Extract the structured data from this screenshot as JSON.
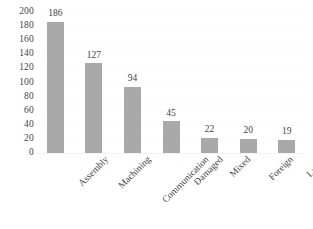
{
  "chart_data": {
    "type": "bar",
    "title": "",
    "xlabel": "",
    "ylabel": "",
    "categories": [
      "Assembly",
      "Machining",
      "Communication",
      "Damaged",
      "Mixed",
      "Foreign",
      "Labels"
    ],
    "values": [
      186,
      127,
      94,
      45,
      22,
      20,
      19
    ],
    "value_labels": [
      "186",
      "127",
      "94",
      "45",
      "22",
      "20",
      "19"
    ],
    "ylim": [
      0,
      200
    ],
    "ytick_step": 20,
    "ytick_labels": [
      "200",
      "180",
      "160",
      "140",
      "120",
      "100",
      "80",
      "60",
      "40",
      "20",
      "0"
    ],
    "ytick_values": [
      200,
      180,
      160,
      140,
      120,
      100,
      80,
      60,
      40,
      20,
      0
    ],
    "grid": true,
    "grid_axis": "y",
    "legend": false,
    "legend_position": "none",
    "bar_color": "#a9a9a9",
    "grid_color": "#fbfbfb",
    "text_color": "#3f3f3f",
    "background_color": "#ffffff",
    "xtick_label_rotation": -45,
    "data_labels_shown": true
  }
}
